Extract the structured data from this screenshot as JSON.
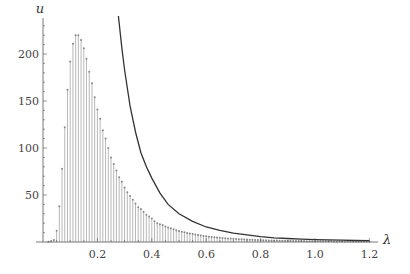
{
  "chart_data": {
    "type": "bar",
    "subtype": "stem plot with overlaid line curve",
    "title": "",
    "xlabel": "λ",
    "ylabel": "u",
    "xlim": [
      0,
      1.22
    ],
    "ylim": [
      0,
      230
    ],
    "x_ticks": [
      0.2,
      0.4,
      0.6,
      0.8,
      1.0,
      1.2
    ],
    "x_tick_labels": [
      "0.2",
      "0.4",
      "0.6",
      "0.8",
      "1.0",
      "1.2"
    ],
    "y_ticks": [
      50,
      100,
      150,
      200
    ],
    "y_tick_labels": [
      "50",
      "100",
      "150",
      "200"
    ],
    "grid": false,
    "legend": null,
    "series": [
      {
        "name": "stems",
        "type": "stem",
        "color": "#9a9a9a",
        "x": [
          0.02,
          0.03,
          0.04,
          0.05,
          0.06,
          0.07,
          0.08,
          0.09,
          0.1,
          0.11,
          0.12,
          0.13,
          0.14,
          0.15,
          0.16,
          0.17,
          0.18,
          0.19,
          0.2,
          0.21,
          0.22,
          0.23,
          0.24,
          0.25,
          0.26,
          0.27,
          0.28,
          0.29,
          0.3,
          0.31,
          0.32,
          0.33,
          0.34,
          0.35,
          0.36,
          0.37,
          0.38,
          0.39,
          0.4,
          0.41,
          0.42,
          0.43,
          0.44,
          0.45,
          0.46,
          0.47,
          0.48,
          0.49,
          0.5,
          0.51,
          0.52,
          0.53,
          0.54,
          0.55,
          0.56,
          0.57,
          0.58,
          0.59,
          0.6,
          0.61,
          0.62,
          0.63,
          0.64,
          0.65,
          0.66,
          0.67,
          0.68,
          0.69,
          0.7,
          0.71,
          0.72,
          0.73,
          0.74,
          0.75,
          0.76,
          0.77,
          0.78,
          0.79,
          0.8,
          0.81,
          0.82,
          0.83,
          0.84,
          0.85,
          0.86,
          0.87,
          0.88,
          0.89,
          0.9,
          0.91,
          0.92,
          0.93,
          0.94,
          0.95,
          0.96,
          0.97,
          0.98,
          0.99,
          1.0,
          1.01,
          1.02,
          1.03,
          1.04,
          1.05,
          1.06,
          1.07,
          1.08,
          1.09,
          1.1,
          1.11,
          1.12,
          1.13,
          1.14,
          1.15,
          1.16,
          1.17,
          1.18,
          1.19,
          1.2
        ],
        "values": [
          0.3,
          1,
          2,
          12,
          38,
          78,
          122,
          162,
          192,
          211,
          220,
          220,
          215,
          206,
          195,
          181,
          169,
          154,
          141,
          131,
          119,
          110,
          100,
          90,
          83,
          76,
          69,
          64,
          58,
          53,
          49,
          45,
          41,
          37,
          35,
          32,
          29,
          27,
          25,
          22,
          20,
          19,
          18,
          16.5,
          15.5,
          14.5,
          13.5,
          12.6,
          11.8,
          11,
          10.3,
          9.6,
          9,
          8.4,
          7.9,
          7.4,
          6.9,
          6.5,
          6.1,
          5.7,
          5.4,
          5.1,
          4.8,
          4.5,
          4.2,
          4,
          3.8,
          3.6,
          3.4,
          3.2,
          3,
          2.9,
          2.7,
          2.6,
          2.5,
          2.3,
          2.2,
          2.1,
          2,
          1.9,
          1.8,
          1.7,
          1.6,
          1.55,
          1.5,
          1.4,
          1.35,
          1.3,
          1.25,
          1.2,
          1.15,
          1.1,
          1.05,
          1,
          0.95,
          0.9,
          0.88,
          0.85,
          0.82,
          0.8,
          0.77,
          0.75,
          0.72,
          0.7,
          0.68,
          0.66,
          0.64,
          0.62,
          0.6,
          0.58,
          0.56,
          0.55,
          0.53,
          0.52,
          0.5,
          0.49,
          0.48,
          0.46,
          0.45
        ]
      },
      {
        "name": "curve",
        "type": "line",
        "color": "#333333",
        "formula_approx": "u ≈ 2.7 / λ^3.5",
        "x": [
          0.29,
          0.3,
          0.32,
          0.34,
          0.36,
          0.38,
          0.4,
          0.43,
          0.46,
          0.5,
          0.55,
          0.6,
          0.65,
          0.7,
          0.75,
          0.8,
          0.85,
          0.9,
          0.95,
          1.0,
          1.05,
          1.1,
          1.15,
          1.2
        ],
        "values": [
          206,
          183,
          145,
          117,
          95,
          80,
          68,
          52,
          40,
          30,
          22,
          16,
          12.5,
          9.5,
          7.5,
          5.6,
          4.5,
          3.7,
          3.0,
          2.5,
          2.2,
          1.9,
          1.6,
          1.4
        ]
      }
    ]
  }
}
